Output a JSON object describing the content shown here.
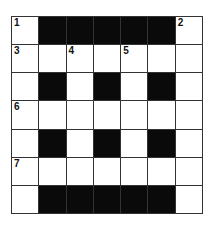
{
  "puzzle": {
    "rows": 7,
    "cols": 7,
    "grid": [
      [
        "W",
        "B",
        "B",
        "B",
        "B",
        "B",
        "W"
      ],
      [
        "W",
        "W",
        "W",
        "W",
        "W",
        "W",
        "W"
      ],
      [
        "W",
        "B",
        "W",
        "B",
        "W",
        "B",
        "W"
      ],
      [
        "W",
        "W",
        "W",
        "W",
        "W",
        "W",
        "W"
      ],
      [
        "W",
        "B",
        "W",
        "B",
        "W",
        "B",
        "W"
      ],
      [
        "W",
        "W",
        "W",
        "W",
        "W",
        "W",
        "W"
      ],
      [
        "W",
        "B",
        "B",
        "B",
        "B",
        "B",
        "W"
      ]
    ],
    "numbers": [
      {
        "row": 0,
        "col": 0,
        "label": "1"
      },
      {
        "row": 0,
        "col": 6,
        "label": "2"
      },
      {
        "row": 1,
        "col": 0,
        "label": "3"
      },
      {
        "row": 1,
        "col": 2,
        "label": "4"
      },
      {
        "row": 1,
        "col": 4,
        "label": "5"
      },
      {
        "row": 3,
        "col": 0,
        "label": "6"
      },
      {
        "row": 5,
        "col": 0,
        "label": "7"
      }
    ],
    "colors": {
      "black": "#0a0a0a",
      "white": "#ffffff",
      "line": "#333333"
    }
  }
}
